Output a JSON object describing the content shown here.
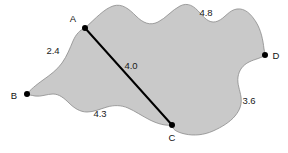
{
  "figure": {
    "type": "geometry-diagram",
    "canvas": {
      "width": 288,
      "height": 153
    },
    "background_color": "#ffffff",
    "region": {
      "name": "shaded-region",
      "fill_color": "#c9c9c9",
      "outline_color": "#8a8a8a",
      "outline_width": 0.8
    },
    "chord": {
      "name": "segment-A-C",
      "from": "A",
      "to": "C",
      "color": "#000000",
      "width": 2.0,
      "length_label": "4.0"
    },
    "vertices": [
      {
        "id": "A",
        "label": "A",
        "x": 85,
        "y": 28,
        "label_x": 73,
        "label_y": 19,
        "dot_r": 3.0,
        "dot_color": "#000000"
      },
      {
        "id": "B",
        "label": "B",
        "x": 27,
        "y": 94,
        "label_x": 14,
        "label_y": 96,
        "dot_r": 3.0,
        "dot_color": "#000000"
      },
      {
        "id": "C",
        "label": "C",
        "x": 172,
        "y": 125,
        "label_x": 172,
        "label_y": 138,
        "dot_r": 3.0,
        "dot_color": "#000000"
      },
      {
        "id": "D",
        "label": "D",
        "x": 265,
        "y": 55,
        "label_x": 276,
        "label_y": 56,
        "dot_r": 3.0,
        "dot_color": "#000000"
      }
    ],
    "measurements": [
      {
        "id": "AB",
        "label": "2.4",
        "x": 53,
        "y": 51
      },
      {
        "id": "AC",
        "label": "4.0",
        "x": 131,
        "y": 66
      },
      {
        "id": "BC",
        "label": "4.3",
        "x": 100,
        "y": 114
      },
      {
        "id": "AD",
        "label": "4.8",
        "x": 206,
        "y": 13
      },
      {
        "id": "CD",
        "label": "3.6",
        "x": 249,
        "y": 101
      }
    ],
    "outline_path": "M 85 28 C 96 18 104 9 113 6 C 122 3 129 9 136 16 C 143 23 150 26 158 22 C 166 18 172 10 180 6 C 188 2 194 6 200 13 C 206 20 211 24 218 21 C 225 18 229 10 237 9 C 245 8 251 14 256 22 C 261 30 263 40 264 49 C 265 53 265 54 265 55 C 262 58 255 59 249 62 C 243 65 239 70 238 77 C 237 84 240 90 241 97 C 242 104 240 110 235 116 C 230 122 222 127 213 131 C 204 135 194 136 185 134 C 176 132 172 129 172 125 C 166 126 158 124 150 120 C 142 116 135 111 128 108 C 121 105 114 105 107 107 C 100 109 94 112 87 112 C 80 112 74 108 69 103 C 64 98 59 94 53 94 C 47 94 41 97 35 96 C 31 95 28 95 27 94 C 30 90 36 85 43 80 C 50 75 57 70 62 63 C 67 56 70 48 73 41 C 76 34 80 30 85 28 Z"
  }
}
